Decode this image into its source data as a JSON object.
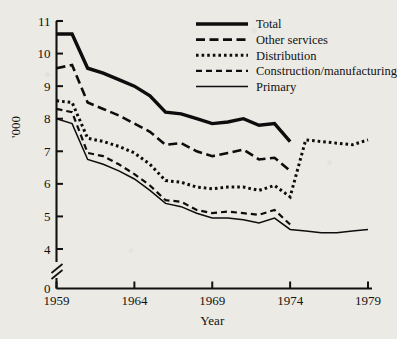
{
  "chart_data": {
    "type": "line",
    "title": "",
    "xlabel": "Year",
    "ylabel": "'000",
    "xlim": [
      1959,
      1979
    ],
    "ylim": [
      4,
      11
    ],
    "y_axis_break": true,
    "y_zero_tick": "0",
    "grid": false,
    "legend_position": "top-right",
    "xticks": [
      "1959",
      "1964",
      "1969",
      "1974",
      "1979"
    ],
    "xtick_values": [
      1959,
      1964,
      1969,
      1974,
      1979
    ],
    "yticks": [
      "0",
      "4",
      "5",
      "6",
      "7",
      "8",
      "9",
      "10",
      "11"
    ],
    "ytick_values": [
      4,
      5,
      6,
      7,
      8,
      9,
      10,
      11
    ],
    "x": [
      1959,
      1960,
      1961,
      1962,
      1963,
      1964,
      1965,
      1966,
      1967,
      1968,
      1969,
      1970,
      1971,
      1972,
      1973,
      1974,
      1975,
      1976,
      1977,
      1978,
      1979
    ],
    "series": [
      {
        "name": "Total",
        "style": "thick-solid",
        "x": [
          1959,
          1960,
          1961,
          1962,
          1963,
          1964,
          1965,
          1966,
          1967,
          1968,
          1969,
          1970,
          1971,
          1972,
          1973,
          1974
        ],
        "values": [
          10.6,
          10.6,
          9.55,
          9.4,
          9.2,
          9.0,
          8.7,
          8.2,
          8.15,
          8.0,
          7.85,
          7.9,
          8.0,
          7.8,
          7.85,
          7.3
        ]
      },
      {
        "name": "Other services",
        "style": "long-dash",
        "x": [
          1959,
          1960,
          1961,
          1962,
          1963,
          1964,
          1965,
          1966,
          1967,
          1968,
          1969,
          1970,
          1971,
          1972,
          1973,
          1974
        ],
        "values": [
          9.55,
          9.65,
          8.5,
          8.3,
          8.1,
          7.85,
          7.6,
          7.2,
          7.25,
          7.0,
          6.85,
          6.95,
          7.05,
          6.75,
          6.8,
          6.4
        ]
      },
      {
        "name": "Distribution",
        "style": "dotted",
        "x": [
          1959,
          1960,
          1961,
          1962,
          1963,
          1964,
          1965,
          1966,
          1967,
          1968,
          1969,
          1970,
          1971,
          1972,
          1973,
          1974,
          1975,
          1976,
          1977,
          1978,
          1979
        ],
        "values": [
          8.55,
          8.5,
          7.4,
          7.3,
          7.15,
          6.95,
          6.6,
          6.1,
          6.05,
          5.9,
          5.85,
          5.9,
          5.9,
          5.8,
          5.95,
          5.6,
          7.35,
          7.3,
          7.25,
          7.2,
          7.35
        ]
      },
      {
        "name": "Construction/manufacturing",
        "style": "medium-dash",
        "x": [
          1959,
          1960,
          1961,
          1962,
          1963,
          1964,
          1965,
          1966,
          1967,
          1968,
          1969,
          1970,
          1971,
          1972,
          1973,
          1974
        ],
        "values": [
          8.3,
          8.2,
          6.95,
          6.85,
          6.6,
          6.3,
          5.95,
          5.5,
          5.45,
          5.2,
          5.1,
          5.15,
          5.1,
          5.05,
          5.2,
          4.75
        ]
      },
      {
        "name": "Primary",
        "style": "thin-solid",
        "x": [
          1959,
          1960,
          1961,
          1962,
          1963,
          1964,
          1965,
          1966,
          1967,
          1968,
          1969,
          1970,
          1971,
          1972,
          1973,
          1974,
          1975,
          1976,
          1977,
          1978,
          1979
        ],
        "values": [
          8.0,
          7.85,
          6.75,
          6.6,
          6.4,
          6.15,
          5.8,
          5.4,
          5.3,
          5.1,
          4.95,
          4.95,
          4.9,
          4.8,
          4.95,
          4.6,
          4.55,
          4.5,
          4.5,
          4.55,
          4.6
        ]
      }
    ],
    "legend": [
      {
        "label": "Total",
        "style": "thick-solid"
      },
      {
        "label": "Other services",
        "style": "long-dash"
      },
      {
        "label": "Distribution",
        "style": "dotted"
      },
      {
        "label": "Construction/manufacturing",
        "style": "medium-dash"
      },
      {
        "label": "Primary",
        "style": "thin-solid"
      }
    ]
  }
}
